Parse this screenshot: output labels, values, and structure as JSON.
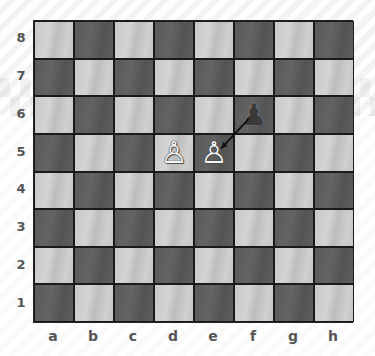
{
  "board": {
    "ranks": [
      "8",
      "7",
      "6",
      "5",
      "4",
      "3",
      "2",
      "1"
    ],
    "files": [
      "a",
      "b",
      "c",
      "d",
      "e",
      "f",
      "g",
      "h"
    ],
    "pieces": [
      {
        "square": "f6",
        "type": "pawn",
        "color": "black",
        "glyph": "♟"
      },
      {
        "square": "d5",
        "type": "pawn",
        "color": "white",
        "glyph": "♙"
      },
      {
        "square": "e5",
        "type": "pawn",
        "color": "white",
        "glyph": "♙"
      }
    ],
    "arrow": {
      "from": "f6",
      "to": "e5",
      "color": "#111111"
    },
    "colors": {
      "light": "#c8c8c8",
      "dark": "#5a5a5a"
    }
  }
}
